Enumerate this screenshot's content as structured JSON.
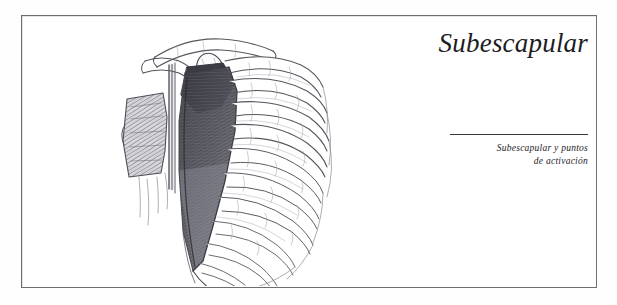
{
  "page": {
    "background_color": "#fefefe",
    "frame_border_color": "#6e6e70",
    "text_color": "#1d1d1f"
  },
  "header": {
    "title": "Subescapular"
  },
  "caption": {
    "line1": "Subescapular y puntos",
    "line2": "de activación",
    "rule_color": "#3a3a3c"
  },
  "illustration": {
    "name": "anatomical-drawing-ribcage-scapula",
    "medium": "graphite pencil drawing",
    "subject": "posterior thorax showing ribcage, scapula, clavicle and vertebral column with subscapularis shading",
    "ink_color": "#5a5a60",
    "shade_color": "#4a4a50"
  }
}
